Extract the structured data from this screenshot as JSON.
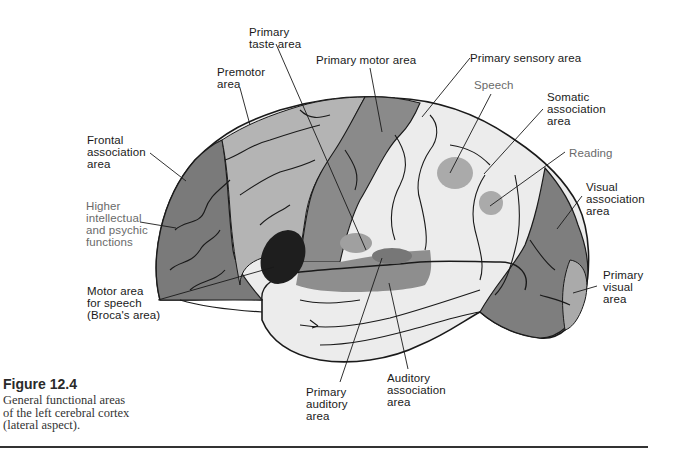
{
  "figure": {
    "title": "Figure 12.4",
    "caption": "General functional areas\nof the left cerebral cortex\n(lateral aspect)."
  },
  "labels": {
    "primary_taste_area": "Primary\ntaste area",
    "premotor_area": "Premotor\narea",
    "primary_motor_area": "Primary motor area",
    "primary_sensory_area": "Primary sensory area",
    "speech": "Speech",
    "somatic_association_area": "Somatic\nassociation\narea",
    "reading": "Reading",
    "visual_association_area": "Visual\nassociation\narea",
    "primary_visual_area": "Primary\nvisual\narea",
    "frontal_association_area": "Frontal\nassociation\narea",
    "higher_intellectual": "Higher\nintellectual\nand psychic\nfunctions",
    "motor_area_speech": "Motor area\nfor speech\n(Broca's area)",
    "primary_auditory_area": "Primary\nauditory\narea",
    "auditory_association_area": "Auditory\nassociation\narea"
  },
  "colors": {
    "dark_region": "#7a7a7a",
    "medium_region": "#b4b4b4",
    "light_region": "#ececec",
    "broca": "#1e1e1e",
    "spot": "#a8a8a8",
    "outline": "#1a1a1a"
  }
}
